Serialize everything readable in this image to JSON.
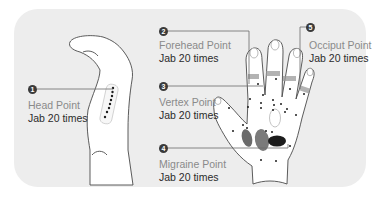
{
  "diagram": {
    "background_color": "#ededed",
    "badge_color": "#3a3a3a",
    "points": [
      {
        "number": "1",
        "name": "Head Point",
        "dose": "Jab 20 times"
      },
      {
        "number": "2",
        "name": "Forehead Point",
        "dose": "Jab 20 times"
      },
      {
        "number": "3",
        "name": "Vertex Point",
        "dose": "Jab 20 times"
      },
      {
        "number": "4",
        "name": "Migraine Point",
        "dose": "Jab 20 times"
      },
      {
        "number": "5",
        "name": "Occiput Point",
        "dose": "Jab 20 times"
      }
    ]
  }
}
